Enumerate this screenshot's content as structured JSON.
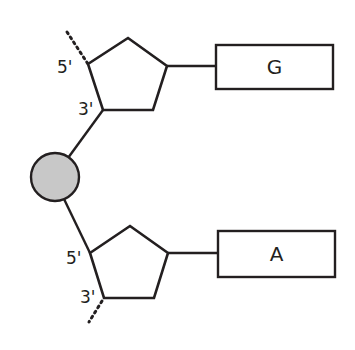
{
  "diagram": {
    "colors": {
      "stroke": "#231f20",
      "phosphate_fill": "#c8c8c8",
      "background": "#ffffff"
    },
    "nucleotides": [
      {
        "position": "top",
        "sugar_labels": {
          "five_prime": "5'",
          "three_prime": "3'"
        },
        "base": "G"
      },
      {
        "position": "bottom",
        "sugar_labels": {
          "five_prime": "5'",
          "three_prime": "3'"
        },
        "base": "A"
      }
    ],
    "phosphate": {
      "label": ""
    }
  }
}
